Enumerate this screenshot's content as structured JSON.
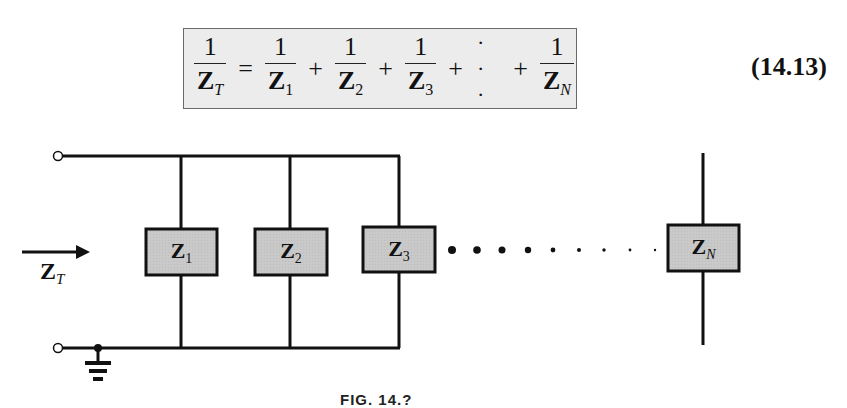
{
  "equation": {
    "lhs": {
      "numerator": "1",
      "denominator_symbol": "Z",
      "denominator_subscript": "T"
    },
    "equals": "=",
    "terms": [
      {
        "numerator": "1",
        "denominator_symbol": "Z",
        "denominator_subscript": "1"
      },
      {
        "numerator": "1",
        "denominator_symbol": "Z",
        "denominator_subscript": "2"
      },
      {
        "numerator": "1",
        "denominator_symbol": "Z",
        "denominator_subscript": "3"
      },
      {
        "numerator": "1",
        "denominator_symbol": "Z",
        "denominator_subscript": "N"
      }
    ],
    "plus": "+",
    "ellipsis": "· · ·",
    "number": "(14.13)",
    "box_background": "#ececec"
  },
  "circuit": {
    "input_label": {
      "symbol": "Z",
      "subscript": "T"
    },
    "branches": [
      {
        "symbol": "Z",
        "subscript": "1"
      },
      {
        "symbol": "Z",
        "subscript": "2"
      },
      {
        "symbol": "Z",
        "subscript": "3"
      },
      {
        "symbol": "Z",
        "subscript": "N"
      }
    ],
    "box_fill": "#c8c8c8",
    "wire_color": "#111111",
    "continuation": "• • • • · · · · ·",
    "ground": "ground-symbol"
  },
  "caption": {
    "text": "FIG. 14.?"
  }
}
